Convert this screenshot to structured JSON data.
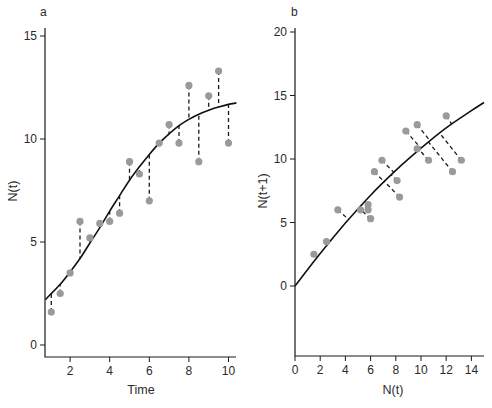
{
  "chart_data": [
    {
      "panel": "a",
      "type": "scatter",
      "title": "",
      "xlabel": "Time",
      "ylabel": "N(t)",
      "xlim": [
        0.75,
        10.4
      ],
      "ylim": [
        -0.5,
        15.5
      ],
      "xticks": [
        2,
        4,
        6,
        8,
        10
      ],
      "yticks": [
        0,
        5,
        10,
        15
      ],
      "grid": false,
      "legend": null,
      "series": [
        {
          "name": "observations",
          "kind": "points",
          "color": "#9a9a9a",
          "x": [
            1.05,
            1.5,
            2.0,
            2.5,
            3.0,
            3.5,
            4.0,
            4.5,
            5.0,
            5.5,
            6.0,
            6.5,
            7.0,
            7.5,
            8.0,
            8.5,
            9.0,
            9.5,
            10.0
          ],
          "y": [
            1.6,
            2.5,
            3.5,
            6.0,
            5.2,
            5.9,
            6.0,
            6.4,
            8.9,
            8.3,
            7.0,
            9.8,
            10.7,
            9.8,
            12.6,
            8.9,
            12.1,
            13.3,
            9.8
          ]
        },
        {
          "name": "fitted logistic curve",
          "kind": "line",
          "color": "#111111",
          "x": [
            0.75,
            1.0,
            1.5,
            2.0,
            2.5,
            3.0,
            3.5,
            4.0,
            4.5,
            5.0,
            5.5,
            6.0,
            6.5,
            7.0,
            7.5,
            8.0,
            8.5,
            9.0,
            9.5,
            10.0,
            10.4
          ],
          "y": [
            2.2,
            2.45,
            2.95,
            3.55,
            4.2,
            4.95,
            5.7,
            6.5,
            7.25,
            8.0,
            8.65,
            9.25,
            9.8,
            10.25,
            10.65,
            10.95,
            11.2,
            11.4,
            11.55,
            11.68,
            11.75
          ]
        }
      ],
      "annotations": [
        "dashed vertical residual lines from each observation to the fitted curve"
      ]
    },
    {
      "panel": "b",
      "type": "scatter",
      "title": "",
      "xlabel": "N(t)",
      "ylabel": "N(t+1)",
      "xlim": [
        0,
        15
      ],
      "ylim": [
        -5.6,
        20.5
      ],
      "xticks": [
        0,
        2,
        4,
        6,
        8,
        10,
        12,
        14
      ],
      "yticks": [
        0,
        5,
        10,
        15,
        20
      ],
      "grid": false,
      "legend": null,
      "series": [
        {
          "name": "observations",
          "kind": "points",
          "color": "#9a9a9a",
          "x": [
            1.5,
            2.5,
            3.4,
            5.2,
            5.8,
            5.8,
            6.0,
            6.3,
            6.9,
            8.1,
            8.3,
            8.8,
            9.7,
            9.7,
            10.6,
            12.0,
            12.5,
            13.2
          ],
          "y": [
            2.5,
            3.5,
            6.0,
            6.0,
            6.4,
            6.0,
            5.3,
            9.0,
            9.9,
            8.3,
            7.0,
            12.2,
            12.7,
            10.8,
            9.9,
            13.4,
            9.0,
            9.9
          ]
        },
        {
          "name": "fitted map curve",
          "kind": "line",
          "color": "#111111",
          "x": [
            0,
            2,
            4,
            6,
            8,
            10,
            12,
            14,
            15
          ],
          "y": [
            0,
            2.55,
            4.95,
            7.15,
            9.1,
            10.85,
            12.45,
            13.8,
            14.45
          ]
        }
      ],
      "annotations": [
        "dashed perpendicular residual lines from each observation to the fitted curve"
      ]
    }
  ],
  "panels": {
    "a": {
      "label": "a",
      "xlabel": "Time",
      "ylabel": "N(t)"
    },
    "b": {
      "label": "b",
      "xlabel": "N(t)",
      "ylabel": "N(t+1)"
    }
  }
}
